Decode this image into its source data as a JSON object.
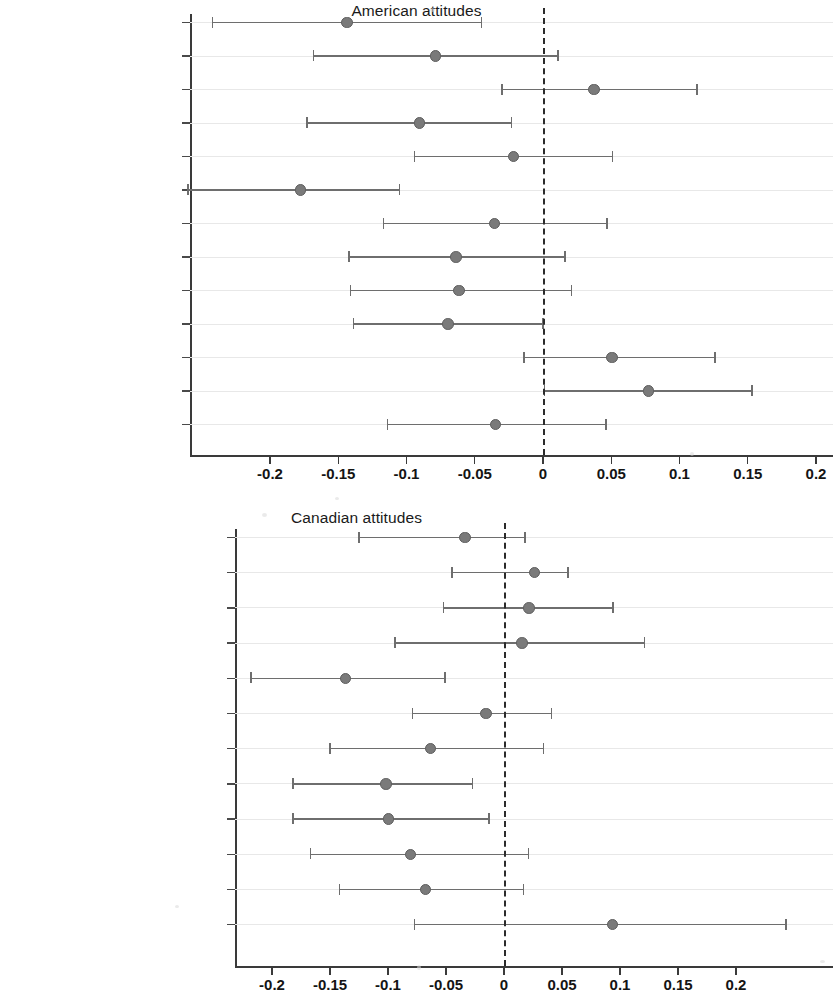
{
  "chart_data": [
    {
      "type": "scatter",
      "title": "American attitudes",
      "xlabel": "",
      "ylabel": "",
      "xlim": [
        -0.265,
        0.205
      ],
      "xticks": [
        -0.2,
        -0.15,
        -0.1,
        -0.05,
        0,
        0.05,
        0.1,
        0.15,
        0.2
      ],
      "xticklabels": [
        "-0.2",
        "-0.15",
        "-0.1",
        "-0.05",
        "0",
        "0.05",
        "0.1",
        "0.15",
        "0.2"
      ],
      "grid": true,
      "reference_line": 0,
      "reference_line_style": "dashed",
      "categories": [
        "Same-sex marriage",
        "Admit more immigrants",
        "Immigrant contributions",
        "Immigrants fit",
        "Minority rights",
        "Women in Congress",
        "American-born first",
        "Non whites",
        "Traditional family values",
        "Discriminate jobs",
        "Share customs",
        "Lay off women",
        "Equal rights"
      ],
      "estimates": [
        -0.144,
        -0.079,
        0.037,
        -0.091,
        -0.022,
        -0.178,
        -0.036,
        -0.064,
        -0.062,
        -0.07,
        0.05,
        0.077,
        -0.035
      ],
      "ci_low": [
        -0.242,
        -0.168,
        -0.03,
        -0.173,
        -0.094,
        -0.26,
        -0.117,
        -0.142,
        -0.141,
        -0.139,
        -0.014,
        0.001,
        -0.114
      ],
      "ci_high": [
        -0.045,
        0.011,
        0.113,
        -0.023,
        0.051,
        -0.105,
        0.047,
        0.016,
        0.021,
        0.0,
        0.126,
        0.153,
        0.046
      ]
    },
    {
      "type": "scatter",
      "title": "Canadian attitudes",
      "xlabel": "",
      "ylabel": "",
      "xlim": [
        -0.232,
        0.245
      ],
      "xticks": [
        -0.2,
        -0.15,
        -0.1,
        -0.05,
        0,
        0.05,
        0.1,
        0.15,
        0.2
      ],
      "xticklabels": [
        "-0.2",
        "-0.15",
        "-0.1",
        "-0.05",
        "0",
        "0.05",
        "0.1",
        "0.15",
        "0.2"
      ],
      "grid": true,
      "reference_line": 0,
      "reference_line_style": "dashed",
      "categories": [
        "Do more for gays and lesbians",
        "Admit more immigrants",
        "Admit more refugees",
        "Majority rule",
        "Women in Congress",
        "Nativism",
        "Do more for racial minorities",
        "Group equality",
        "Equalize",
        "Adapt our customs",
        "Do more for women",
        "Equal rights"
      ],
      "estimates": [
        -0.034,
        0.026,
        0.021,
        0.015,
        -0.137,
        -0.016,
        -0.064,
        -0.102,
        -0.1,
        -0.081,
        -0.068,
        0.093
      ],
      "ci_low": [
        -0.125,
        -0.045,
        -0.052,
        -0.094,
        -0.218,
        -0.079,
        -0.15,
        -0.182,
        -0.182,
        -0.167,
        -0.142,
        -0.077
      ],
      "ci_high": [
        0.018,
        0.055,
        0.094,
        0.121,
        -0.051,
        0.041,
        0.034,
        -0.027,
        -0.013,
        0.021,
        0.017,
        0.243
      ]
    }
  ]
}
